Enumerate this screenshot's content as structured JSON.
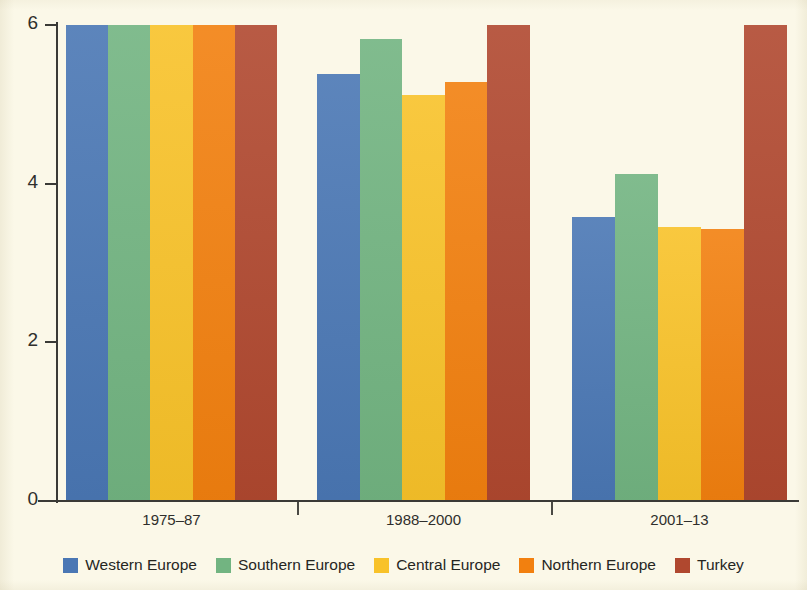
{
  "chart_data": {
    "type": "bar",
    "title": "",
    "subtitle": "",
    "xlabel": "",
    "ylabel": "",
    "grid": false,
    "legend_position": "bottom",
    "orientation": "vertical",
    "grouping": "grouped",
    "categories": [
      "1975–87",
      "1988–2000",
      "2001–13"
    ],
    "ylim": [
      0,
      6
    ],
    "yticks": [
      0,
      2,
      4,
      6
    ],
    "ytick_labels": [
      "0",
      "2",
      "4",
      "6"
    ],
    "series": [
      {
        "name": "Western Europe",
        "color": "#4a77b4",
        "values": [
          6.0,
          5.38,
          3.58
        ]
      },
      {
        "name": "Southern Europe",
        "color": "#72b481",
        "values": [
          6.0,
          5.82,
          4.12
        ]
      },
      {
        "name": "Central Europe",
        "color": "#f8c229",
        "values": [
          6.0,
          5.12,
          3.46
        ]
      },
      {
        "name": "Northern Europe",
        "color": "#f2800f",
        "values": [
          6.0,
          5.28,
          3.43
        ]
      },
      {
        "name": "Turkey",
        "color": "#b0482f",
        "values": [
          6.0,
          6.0,
          6.0
        ]
      }
    ]
  },
  "axis": {
    "y_tick_labels": [
      "6",
      "4",
      "2",
      "0"
    ],
    "y_tick_values": [
      6,
      4,
      2,
      0
    ]
  },
  "legend": {
    "items": [
      {
        "label": "Western Europe",
        "color": "#4a77b4"
      },
      {
        "label": "Southern Europe",
        "color": "#72b481"
      },
      {
        "label": "Central Europe",
        "color": "#f8c229"
      },
      {
        "label": "Northern Europe",
        "color": "#f2800f"
      },
      {
        "label": "Turkey",
        "color": "#b0482f"
      }
    ]
  },
  "colors": {
    "background": "#fbf8e8",
    "axis": "#3a3a36",
    "text": "#2f2f2c"
  }
}
